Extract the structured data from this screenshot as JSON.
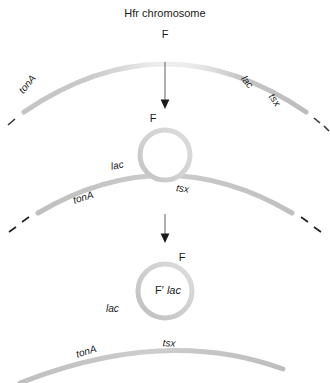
{
  "figure": {
    "title": "Hfr chromosome",
    "width": 330,
    "height": 383,
    "background": "#ffffff",
    "type": "biology-process-diagram",
    "colors": {
      "chromosome_stroke": "#bdbdbd",
      "chromosome_stroke_light": "#e2e2e2",
      "f_region_stroke": "#d9d9d9",
      "plasmid_stroke": "#c8c8c8",
      "plasmid_stroke_light": "#dedede",
      "arrow": "#4d4d4d",
      "dash": "#333333",
      "text": "#1a1a1a"
    }
  },
  "stages": [
    {
      "id": "stage-1",
      "name": "hfr-chromosome",
      "title": "Hfr chromosome",
      "f_label": "F",
      "genes": [
        "tonA",
        "lac",
        "tsx"
      ],
      "dashes": 3
    },
    {
      "id": "stage-2",
      "name": "f-factor-looping-out",
      "f_label": "F",
      "genes": [
        "lac",
        "tonA",
        "tsx"
      ],
      "dashes": 4
    },
    {
      "id": "stage-3",
      "name": "f-prime-plasmid-excised",
      "f_label": "F",
      "plasmid_label_prefix": "F",
      "plasmid_label_prime": "′",
      "plasmid_label_gene": "lac",
      "genes": [
        "lac",
        "tonA",
        "tsx"
      ],
      "dashes": 0
    }
  ],
  "labels": {
    "title": "Hfr chromosome",
    "f1": "F",
    "tonA1": "tonA",
    "lac1": "lac",
    "tsx1": "tsx",
    "f2": "F",
    "lac2": "lac",
    "tonA2": "tonA",
    "tsx2": "tsx",
    "f3": "F",
    "fprime_f": "F",
    "fprime_prime": "′",
    "fprime_lac": "lac",
    "lac3": "lac",
    "tonA3": "tonA",
    "tsx3": "tsx"
  },
  "arrows": [
    {
      "name": "arrow-stage1-to-stage2",
      "glyph": "down-arrow"
    },
    {
      "name": "arrow-stage2-to-stage3",
      "glyph": "down-arrow"
    }
  ]
}
